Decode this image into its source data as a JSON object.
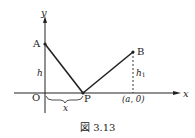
{
  "figure": {
    "caption": "図 3.13",
    "axes": {
      "x_label": "x",
      "y_label": "y",
      "origin_label": "O"
    },
    "points": {
      "A": {
        "label": "A"
      },
      "B": {
        "label": "B"
      },
      "P": {
        "label": "P"
      }
    },
    "annotations": {
      "h": "h",
      "h1_main": "h",
      "h1_sub": "1",
      "x_distance": "x",
      "a_coord": "(a, 0)"
    },
    "colors": {
      "ink": "#222222",
      "background": "#ffffff"
    }
  }
}
